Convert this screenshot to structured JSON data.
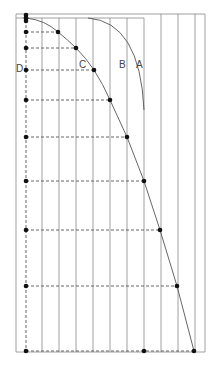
{
  "diagram": {
    "labels": {
      "A": "A",
      "B": "B",
      "C": "C",
      "D": "D"
    },
    "colors": {
      "line": "#888888",
      "curve": "#555555",
      "dot": "#111111",
      "dash": "#555555"
    },
    "frame": {
      "outer": {
        "x1": 16,
        "y1": 14,
        "x2": 205,
        "y2": 352
      },
      "inner_top_right_x": 144,
      "inner_top_y": 18
    },
    "vertical_lines_x": [
      16,
      42,
      59,
      76,
      93,
      110,
      127,
      144,
      161,
      178,
      195,
      205
    ],
    "axis_x": 26,
    "points": [
      {
        "x": 26,
        "y": 18,
        "hx": 26
      },
      {
        "x": 58,
        "y": 32,
        "hx": 58
      },
      {
        "x": 76,
        "y": 48,
        "hx": 76
      },
      {
        "x": 94,
        "y": 70,
        "hx": 94
      },
      {
        "x": 110,
        "y": 100,
        "hx": 110
      },
      {
        "x": 127,
        "y": 137,
        "hx": 127
      },
      {
        "x": 144,
        "y": 181,
        "hx": 144
      },
      {
        "x": 160,
        "y": 230,
        "hx": 160
      },
      {
        "x": 177,
        "y": 286,
        "hx": 177
      },
      {
        "x": 194,
        "y": 351,
        "hx": 194
      }
    ],
    "axis_points_y": [
      15,
      18,
      21,
      32,
      48,
      70,
      100,
      137,
      181,
      230,
      286,
      351
    ],
    "bottom_extra_point": {
      "x": 144,
      "y": 351
    }
  }
}
